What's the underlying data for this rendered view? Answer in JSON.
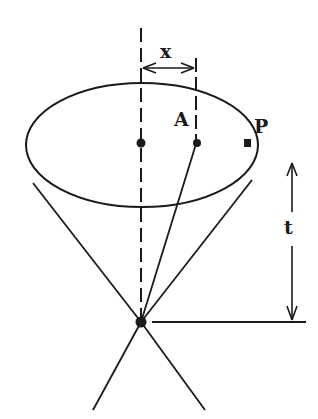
{
  "diagram": {
    "type": "light-cone geometry",
    "labels": {
      "x": "x",
      "A": "A",
      "P": "P",
      "t": "t"
    },
    "colors": {
      "stroke": "#1a1a1a",
      "background": "#ffffff"
    }
  }
}
